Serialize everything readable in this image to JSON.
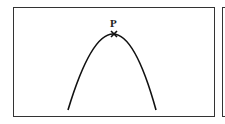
{
  "diagram": {
    "point_label": "P",
    "curve": {
      "type": "parabola-downward",
      "left_end": [
        68,
        110
      ],
      "apex": [
        114,
        34
      ],
      "right_end": [
        156,
        110
      ]
    },
    "colors": {
      "stroke": "#111111",
      "border": "#333333",
      "background": "#ffffff"
    }
  }
}
